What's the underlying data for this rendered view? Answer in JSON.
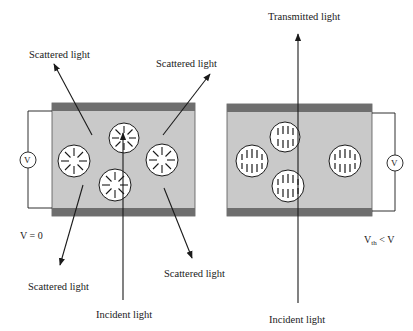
{
  "figure": {
    "left_panel": {
      "condition_label": "V = 0",
      "voltmeter_symbol": "V",
      "labels": {
        "scattered_top_left": "Scattered light",
        "scattered_top_right": "Scattered light",
        "scattered_bottom_left": "Scattered light",
        "scattered_bottom_right": "Scattered light",
        "incident": "Incident light"
      },
      "droplet_state": "random (radial director) — light scattered"
    },
    "right_panel": {
      "condition_label_main": "V",
      "condition_label_sub": "th",
      "condition_label_rest": " <  V",
      "voltmeter_symbol": "V",
      "labels": {
        "transmitted": "Transmitted light",
        "incident": "Incident light"
      },
      "droplet_state": "aligned (vertical director) — light transmitted"
    },
    "colors": {
      "cell_fill": "#c9c9c9",
      "electrode": "#6e6e6e",
      "droplet_fill": "#ffffff",
      "line": "#1a1a1a"
    }
  }
}
